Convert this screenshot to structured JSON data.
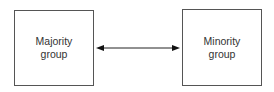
{
  "diagram": {
    "nodes": [
      {
        "id": "majority",
        "label": "Majority\ngroup"
      },
      {
        "id": "minority",
        "label": "Minority\ngroup"
      }
    ],
    "edges": [
      {
        "from": "majority",
        "to": "minority",
        "direction": "bidirectional"
      }
    ],
    "colors": {
      "stroke": "#555555",
      "arrow": "#111111",
      "text": "#333333"
    }
  }
}
